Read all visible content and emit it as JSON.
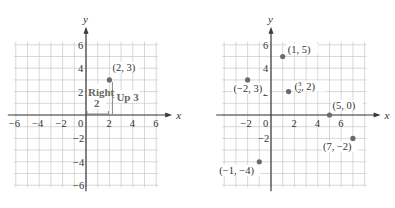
{
  "chart_data": [
    {
      "type": "scatter",
      "title": "",
      "xlabel": "x",
      "ylabel": "y",
      "xlim": [
        -6,
        6
      ],
      "ylim": [
        -6,
        6
      ],
      "grid": true,
      "x_ticks": [
        "-6",
        "-4",
        "-2",
        "0",
        "2",
        "4",
        "6"
      ],
      "y_ticks": [
        "6",
        "4",
        "2",
        "-2",
        "-4",
        "-6"
      ],
      "points": [
        {
          "x": 2,
          "y": 3,
          "label": "(2, 3)"
        }
      ],
      "annotations": [
        {
          "text_line1": "Right",
          "text_line2": "2",
          "kind": "horizontal-bracket"
        },
        {
          "text": "Up 3",
          "kind": "vertical-bracket"
        }
      ]
    },
    {
      "type": "scatter",
      "title": "",
      "xlabel": "x",
      "ylabel": "y",
      "xlim": [
        -4,
        8
      ],
      "ylim": [
        -6,
        6
      ],
      "grid": true,
      "x_ticks": [
        "-2",
        "0",
        "2",
        "4",
        "6"
      ],
      "y_ticks": [
        "6",
        "4",
        "2",
        "-2"
      ],
      "points": [
        {
          "x": 1,
          "y": 5,
          "label": "(1, 5)"
        },
        {
          "x": -2,
          "y": 3,
          "label": "(−2, 3)"
        },
        {
          "x": 1.5,
          "y": 2,
          "label_num": "3",
          "label_den": "2",
          "label_rest": ", 2)"
        },
        {
          "x": 5,
          "y": 0,
          "label": "(5, 0)"
        },
        {
          "x": 7,
          "y": -2,
          "label": "(7, −2)"
        },
        {
          "x": -1,
          "y": -4,
          "label": "(−1, −4)"
        }
      ]
    }
  ],
  "labels": {
    "open_paren": "(",
    "x_axis": "x",
    "y_axis": "y"
  }
}
